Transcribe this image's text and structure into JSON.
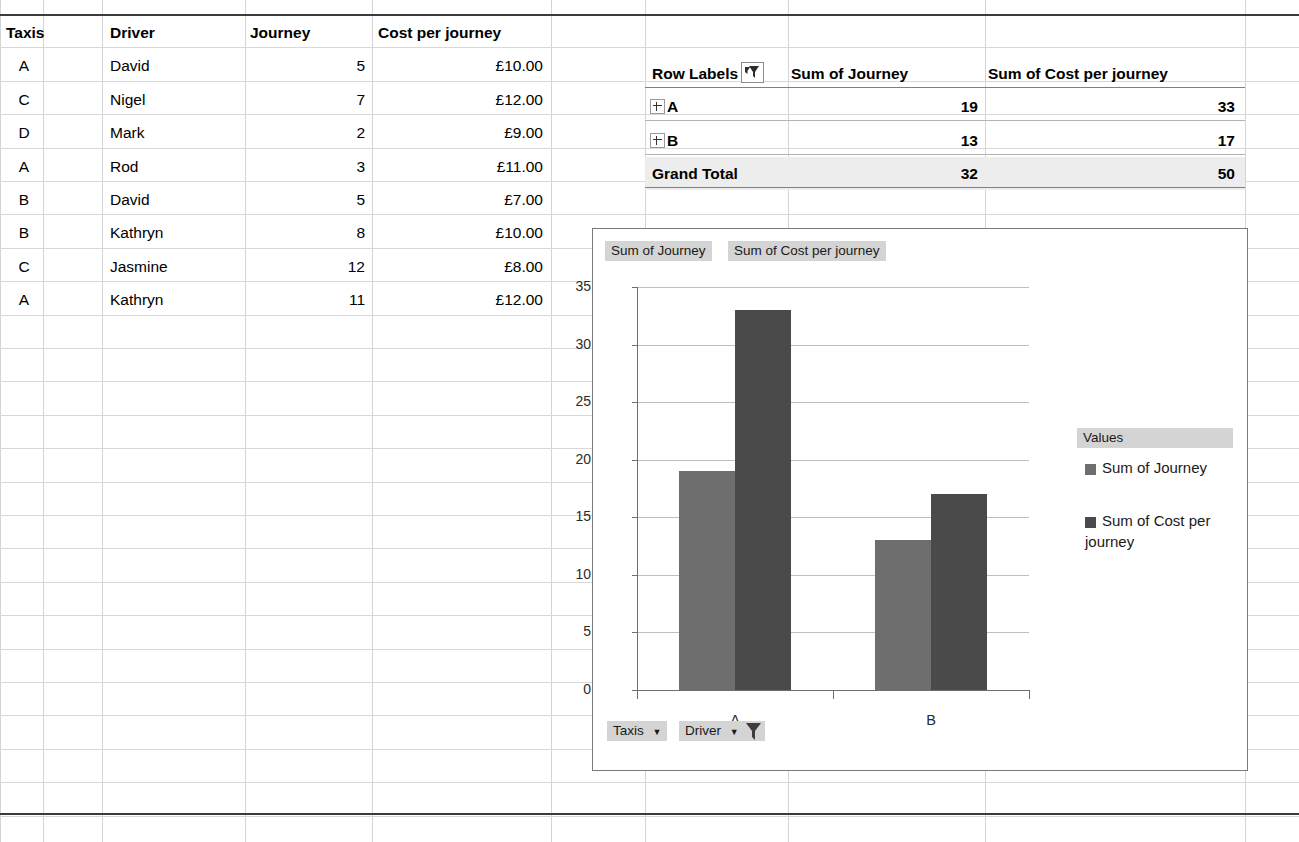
{
  "sheet": {
    "source_table": {
      "headers": [
        "Taxis",
        "Driver",
        "Journey",
        "Cost per journey"
      ],
      "rows": [
        {
          "taxi": "A",
          "driver": "David",
          "journey": "5",
          "cost": "£10.00"
        },
        {
          "taxi": "C",
          "driver": "Nigel",
          "journey": "7",
          "cost": "£12.00"
        },
        {
          "taxi": "D",
          "driver": "Mark",
          "journey": "2",
          "cost": "£9.00"
        },
        {
          "taxi": "A",
          "driver": "Rod",
          "journey": "3",
          "cost": "£11.00"
        },
        {
          "taxi": "B",
          "driver": "David",
          "journey": "5",
          "cost": "£7.00"
        },
        {
          "taxi": "B",
          "driver": "Kathryn",
          "journey": "8",
          "cost": "£10.00"
        },
        {
          "taxi": "C",
          "driver": "Jasmine",
          "journey": "12",
          "cost": "£8.00"
        },
        {
          "taxi": "A",
          "driver": "Kathryn",
          "journey": "11",
          "cost": "£12.00"
        }
      ]
    },
    "pivot_table": {
      "headers": [
        "Row Labels",
        "Sum of Journey",
        "Sum of Cost per journey"
      ],
      "filter_icon": "filter-funnel-icon",
      "rows": [
        {
          "label": "A",
          "expand_icon": "expand-plus-icon",
          "journey": "19",
          "cost": "33"
        },
        {
          "label": "B",
          "expand_icon": "expand-plus-icon",
          "journey": "13",
          "cost": "17"
        }
      ],
      "total": {
        "label": "Grand Total",
        "journey": "32",
        "cost": "50"
      }
    }
  },
  "chart": {
    "field_buttons": [
      {
        "label": "Sum of Journey"
      },
      {
        "label": "Sum of Cost per journey"
      }
    ],
    "axis_buttons": [
      {
        "label": "Taxis",
        "icon": "chevron-down-icon"
      },
      {
        "label": "Driver",
        "icon": "chevron-down-filter-icon"
      }
    ],
    "legend": {
      "header": "Values",
      "entries": [
        {
          "label": "Sum of Journey",
          "color": "#6e6e6e"
        },
        {
          "label": "Sum of Cost per journey",
          "color": "#4a4a4a"
        }
      ]
    }
  },
  "chart_data": {
    "type": "bar",
    "title": "",
    "categories": [
      "A",
      "B"
    ],
    "series": [
      {
        "name": "Sum of Journey",
        "values": [
          19,
          13
        ],
        "color": "#6e6e6e"
      },
      {
        "name": "Sum of Cost per journey",
        "values": [
          33,
          17
        ],
        "color": "#4a4a4a"
      }
    ],
    "xlabel": "",
    "ylabel": "",
    "ylim": [
      0,
      35
    ],
    "yticks": [
      0,
      5,
      10,
      15,
      20,
      25,
      30,
      35
    ],
    "grid": true,
    "legend_position": "right"
  },
  "colors": {
    "series1": "#6e6e6e",
    "series2": "#4a4a4a",
    "field_button_bg": "#d4d4d4",
    "pivot_total_bg": "#ededed",
    "gridline": "#bfbfbf"
  }
}
